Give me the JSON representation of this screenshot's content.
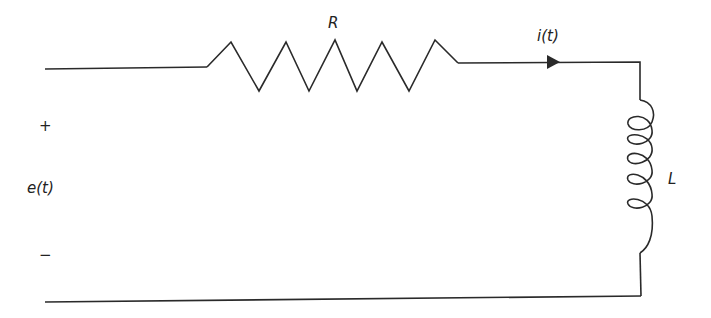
{
  "diagram": {
    "type": "RL series circuit",
    "source": {
      "label": "e(t)",
      "plus": "+",
      "minus": "−"
    },
    "resistor": {
      "label": "R"
    },
    "current": {
      "label": "i(t)"
    },
    "inductor": {
      "label": "L"
    }
  },
  "colors": {
    "stroke": "#2a2a2a",
    "background": "#ffffff"
  }
}
